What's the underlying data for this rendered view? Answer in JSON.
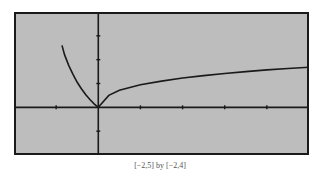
{
  "caption": "[−2,5] by [−2,4]",
  "colors": {
    "screen_bg": "#bdbdbd",
    "curve": "#1a1a1a",
    "axis": "#1a1a1a"
  },
  "chart_data": {
    "type": "line",
    "title": "",
    "xlabel": "",
    "ylabel": "",
    "xlim": [
      -2,
      5
    ],
    "ylim": [
      -2,
      4
    ],
    "grid": false,
    "xticks": [
      -1,
      1,
      2,
      3,
      4,
      5
    ],
    "yticks": [
      -1,
      1,
      2,
      3,
      4
    ],
    "series": [
      {
        "name": "left branch",
        "x": [
          -0.86,
          -0.8,
          -0.7,
          -0.6,
          -0.5,
          -0.4,
          -0.3,
          -0.2,
          -0.1,
          0
        ],
        "y": [
          2.6,
          2.2,
          1.75,
          1.38,
          1.05,
          0.78,
          0.54,
          0.33,
          0.15,
          0
        ]
      },
      {
        "name": "right branch",
        "x": [
          0,
          0.25,
          0.5,
          1,
          1.5,
          2,
          2.5,
          3,
          3.5,
          4,
          4.5,
          5
        ],
        "y": [
          0,
          0.5,
          0.72,
          0.95,
          1.1,
          1.23,
          1.33,
          1.42,
          1.5,
          1.57,
          1.63,
          1.68
        ]
      }
    ],
    "caption": "[−2,5] by [−2,4]"
  }
}
